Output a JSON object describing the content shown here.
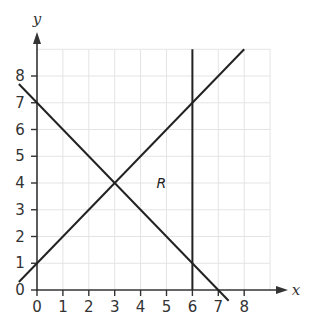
{
  "chart_data": {
    "type": "line",
    "title": "",
    "xlabel": "x",
    "ylabel": "y",
    "xlim": [
      0,
      9
    ],
    "ylim": [
      0,
      9
    ],
    "grid": true,
    "x_ticks": [
      "0",
      "1",
      "2",
      "3",
      "4",
      "5",
      "6",
      "7",
      "8"
    ],
    "y_ticks": [
      "0",
      "1",
      "2",
      "3",
      "4",
      "5",
      "6",
      "7",
      "8"
    ],
    "series": [
      {
        "name": "y = x + 1",
        "points": [
          [
            -0.7,
            0.3
          ],
          [
            8,
            9
          ]
        ]
      },
      {
        "name": "y = 7 - x",
        "points": [
          [
            -0.7,
            7.7
          ],
          [
            7.4,
            -0.4
          ]
        ]
      },
      {
        "name": "x = 6",
        "points": [
          [
            6,
            0
          ],
          [
            6,
            9
          ]
        ]
      }
    ],
    "annotations": [
      {
        "text": "R",
        "x": 4.8,
        "y": 4
      }
    ],
    "intersections": [
      [
        3,
        4
      ],
      [
        6,
        7
      ],
      [
        6,
        1
      ]
    ]
  },
  "labels": {
    "x_axis": "x",
    "y_axis": "y",
    "region": "R",
    "x_ticks": [
      "0",
      "1",
      "2",
      "3",
      "4",
      "5",
      "6",
      "7",
      "8"
    ],
    "y_ticks": [
      "0",
      "1",
      "2",
      "3",
      "4",
      "5",
      "6",
      "7",
      "8"
    ]
  }
}
